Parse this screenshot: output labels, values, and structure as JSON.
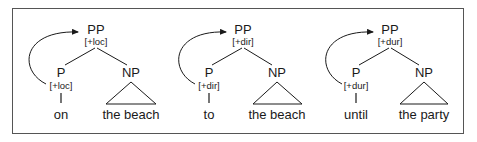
{
  "diagram": {
    "trees": [
      {
        "root": "PP",
        "root_feature": "[+loc]",
        "head": "P",
        "head_feature": "[+loc]",
        "head_word": "on",
        "complement": "NP",
        "complement_words": "the beach"
      },
      {
        "root": "PP",
        "root_feature": "[+dir]",
        "head": "P",
        "head_feature": "[+dir]",
        "head_word": "to",
        "complement": "NP",
        "complement_words": "the beach"
      },
      {
        "root": "PP",
        "root_feature": "[+dur]",
        "head": "P",
        "head_feature": "[+dur]",
        "head_word": "until",
        "complement": "NP",
        "complement_words": "the party"
      }
    ],
    "colors": {
      "ink": "#1a1a1a",
      "frame": "#555555",
      "background": "#ffffff"
    }
  }
}
